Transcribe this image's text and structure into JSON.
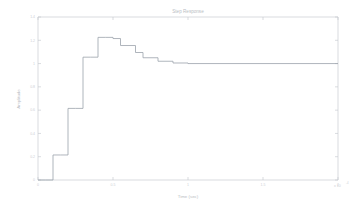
{
  "figure": {
    "title": "Step Response",
    "background": "#ffffff",
    "line_color": "#9ba2ab",
    "axis_color": "#c9ccd1",
    "text_color": "#bcc0c6"
  },
  "axes": {
    "xlabel": "Time (sec)",
    "ylabel": "Amplitude",
    "x_exponent": "x 10",
    "x_exponent_sup": "-4",
    "xticks": [
      "0",
      "0.5",
      "1",
      "1.5",
      "2"
    ],
    "yticks": [
      "0",
      "0.2",
      "0.4",
      "0.6",
      "0.8",
      "1",
      "1.2",
      "1.4"
    ]
  },
  "chart_data": {
    "type": "line",
    "title": "Step Response",
    "xlabel": "Time (sec)",
    "ylabel": "Amplitude",
    "xlim": [
      0,
      2
    ],
    "ylim": [
      0,
      1.4
    ],
    "x_scale_exponent": -4,
    "grid": false,
    "legend": null,
    "style": "stairs",
    "series": [
      {
        "name": "Step Response",
        "x": [
          0.0,
          0.05,
          0.1,
          0.15,
          0.2,
          0.25,
          0.3,
          0.35,
          0.4,
          0.45,
          0.5,
          0.55,
          0.6,
          0.65,
          0.7,
          0.8,
          0.9,
          1.0,
          1.2,
          1.4,
          1.6,
          1.8,
          2.0
        ],
        "values": [
          0.0,
          0.0,
          0.215,
          0.215,
          0.615,
          0.615,
          1.055,
          1.055,
          1.225,
          1.225,
          1.215,
          1.155,
          1.155,
          1.095,
          1.05,
          1.02,
          1.005,
          1.0,
          1.0,
          1.0,
          1.0,
          1.0,
          1.0
        ]
      }
    ]
  }
}
